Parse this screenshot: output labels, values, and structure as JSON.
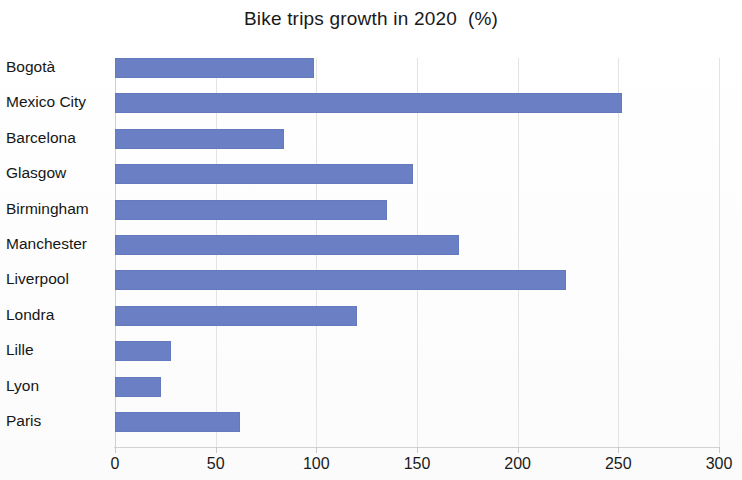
{
  "chart": {
    "title": "Bike trips growth in 2020  (%)"
  },
  "chart_data": {
    "type": "bar",
    "orientation": "horizontal",
    "title": "Bike trips growth in 2020  (%)",
    "xlabel": "",
    "ylabel": "",
    "xlim": [
      0,
      300
    ],
    "xticks": [
      0,
      50,
      100,
      150,
      200,
      250,
      300
    ],
    "grid": true,
    "legend": "none",
    "bar_color": "#6b80c4",
    "categories": [
      "Bogotà",
      "Mexico City",
      "Barcelona",
      "Glasgow",
      "Birmingham",
      "Manchester",
      "Liverpool",
      "Londra",
      "Lille",
      "Lyon",
      "Paris"
    ],
    "values": [
      99,
      252,
      84,
      148,
      135,
      171,
      224,
      120,
      28,
      23,
      62
    ],
    "units": "%"
  }
}
